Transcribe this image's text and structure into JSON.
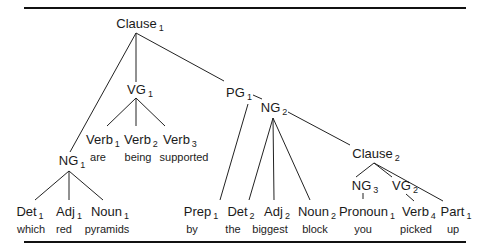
{
  "diagram": {
    "type": "parse-tree",
    "sentence": "which red pyramids are being supported by the biggest block you picked up",
    "nodes": {
      "clause1": {
        "label": "Clause",
        "index": "1"
      },
      "vg1": {
        "label": "VG",
        "index": "1"
      },
      "pg1": {
        "label": "PG",
        "index": "1"
      },
      "ng2": {
        "label": "NG",
        "index": "2"
      },
      "ng1": {
        "label": "NG",
        "index": "1"
      },
      "clause2": {
        "label": "Clause",
        "index": "2"
      },
      "ng3": {
        "label": "NG",
        "index": "3"
      },
      "vg2": {
        "label": "VG",
        "index": "2"
      }
    },
    "leaves": [
      {
        "label": "Det",
        "index": "1",
        "word": "which"
      },
      {
        "label": "Adj",
        "index": "1",
        "word": "red"
      },
      {
        "label": "Noun",
        "index": "1",
        "word": "pyramids"
      },
      {
        "label": "Verb",
        "index": "1",
        "word": "are"
      },
      {
        "label": "Verb",
        "index": "2",
        "word": "being"
      },
      {
        "label": "Verb",
        "index": "3",
        "word": "supported"
      },
      {
        "label": "Prep",
        "index": "1",
        "word": "by"
      },
      {
        "label": "Det",
        "index": "2",
        "word": "the"
      },
      {
        "label": "Adj",
        "index": "2",
        "word": "biggest"
      },
      {
        "label": "Noun",
        "index": "2",
        "word": "block"
      },
      {
        "label": "Pronoun",
        "index": "1",
        "word": "you"
      },
      {
        "label": "Verb",
        "index": "4",
        "word": "picked"
      },
      {
        "label": "Part",
        "index": "1",
        "word": "up"
      }
    ]
  }
}
